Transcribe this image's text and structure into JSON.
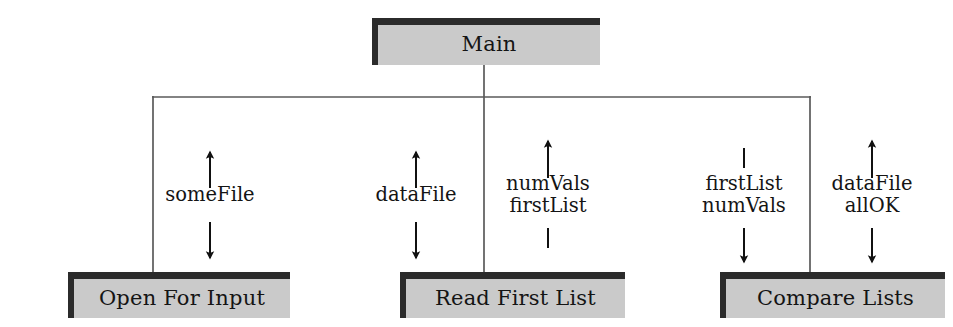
{
  "diagram": {
    "type": "structure-chart",
    "colors": {
      "box_fill": "#cacaca",
      "box_border": "#2b2b2b",
      "line": "#5a5a5a",
      "arrow": "#111111",
      "background": "#ffffff",
      "text": "#141414"
    }
  },
  "modules": [
    {
      "id": "main",
      "label": "Main",
      "x": 372,
      "y": 18,
      "w": 228,
      "h": 47,
      "level": "top"
    },
    {
      "id": "open-for-input",
      "label": "Open For Input",
      "x": 68,
      "y": 272,
      "w": 222,
      "h": 46,
      "level": "bottom"
    },
    {
      "id": "read-first-list",
      "label": "Read First List",
      "x": 400,
      "y": 272,
      "w": 225,
      "h": 46,
      "level": "bottom"
    },
    {
      "id": "compare-lists",
      "label": "Compare Lists",
      "x": 720,
      "y": 272,
      "w": 225,
      "h": 46,
      "level": "bottom"
    }
  ],
  "couples": [
    {
      "id": "somefile",
      "lines": [
        "someFile"
      ],
      "above": "arrow-up",
      "below": "arrow-down",
      "x": 210,
      "y": 195,
      "parent": "main",
      "child": "open-for-input"
    },
    {
      "id": "datafile",
      "lines": [
        "dataFile"
      ],
      "above": "arrow-up",
      "below": "arrow-down",
      "x": 416,
      "y": 195,
      "parent": "main",
      "child": "read-first-list"
    },
    {
      "id": "numvals-firstlist",
      "lines": [
        "numVals",
        "firstList"
      ],
      "above": "arrow-up",
      "below": "plain-line",
      "x": 548,
      "y": 195,
      "parent": "read-first-list",
      "child": "main"
    },
    {
      "id": "firstlist-numvals",
      "lines": [
        "firstList",
        "numVals"
      ],
      "above": "plain-line",
      "below": "arrow-down",
      "x": 744,
      "y": 195,
      "parent": "main",
      "child": "compare-lists"
    },
    {
      "id": "datafile-allok",
      "lines": [
        "dataFile",
        "allOK"
      ],
      "above": "arrow-up",
      "below": "arrow-down",
      "x": 872,
      "y": 195,
      "parent": "main",
      "child": "compare-lists"
    }
  ],
  "connectors": {
    "main_stem_x": 484,
    "bus_y": 97,
    "bus_left_x": 153,
    "bus_right_x": 810,
    "main_bottom_y": 65,
    "children_top_y": 272
  }
}
